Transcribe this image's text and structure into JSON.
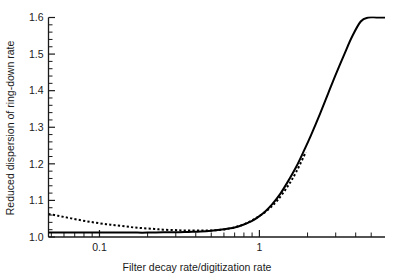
{
  "chart_data": {
    "type": "line",
    "title": "",
    "xlabel": "Filter decay rate/digitization rate",
    "ylabel": "Reduced dispersion of ring-down rate",
    "xscale": "log",
    "yscale": "linear",
    "xlim": [
      0.048,
      6.1
    ],
    "ylim": [
      1.0,
      1.6
    ],
    "grid": false,
    "legend": "none",
    "x_tick_labels": [
      "0.1",
      "1"
    ],
    "x_tick_values": [
      0.1,
      1
    ],
    "x_minor_ticks": [
      0.05,
      0.06,
      0.07,
      0.08,
      0.09,
      0.2,
      0.3,
      0.4,
      0.5,
      0.6,
      0.7,
      0.8,
      0.9,
      2,
      3,
      4,
      5
    ],
    "y_tick_labels": [
      "1.0",
      "1.1",
      "1.2",
      "1.3",
      "1.4",
      "1.5",
      "1.6"
    ],
    "y_tick_values": [
      1.0,
      1.1,
      1.2,
      1.3,
      1.4,
      1.5,
      1.6
    ],
    "y_minor_tick_count_between_majors": 4,
    "series": [
      {
        "name": "solid-curve",
        "style": "solid",
        "color": "#000000",
        "x": [
          0.048,
          0.06,
          0.08,
          0.1,
          0.13,
          0.16,
          0.2,
          0.25,
          0.3,
          0.36,
          0.43,
          0.5,
          0.6,
          0.7,
          0.8,
          0.9,
          1.0,
          1.1,
          1.2,
          1.35,
          1.5,
          1.7,
          1.9,
          2.1,
          2.4,
          2.7,
          3.0,
          3.4,
          3.8,
          4.3,
          4.8,
          5.4,
          6.1
        ],
        "y": [
          1.012,
          1.012,
          1.012,
          1.012,
          1.012,
          1.012,
          1.012,
          1.013,
          1.013,
          1.014,
          1.015,
          1.017,
          1.021,
          1.026,
          1.034,
          1.044,
          1.057,
          1.072,
          1.089,
          1.118,
          1.15,
          1.192,
          1.236,
          1.278,
          1.338,
          1.394,
          1.444,
          1.5,
          1.548,
          1.589,
          1.6,
          1.6,
          1.6
        ]
      },
      {
        "name": "dotted-curve",
        "style": "dotted",
        "color": "#000000",
        "x": [
          0.048,
          0.055,
          0.063,
          0.072,
          0.083,
          0.095,
          0.11,
          0.125,
          0.145,
          0.165,
          0.19,
          0.22,
          0.25,
          0.29,
          0.33,
          0.38,
          0.44,
          0.5,
          0.58,
          0.66,
          0.76,
          0.87,
          1.0,
          1.15,
          1.3,
          1.5,
          1.7,
          1.95
        ],
        "y": [
          1.063,
          1.058,
          1.053,
          1.048,
          1.043,
          1.039,
          1.035,
          1.032,
          1.029,
          1.026,
          1.024,
          1.022,
          1.02,
          1.019,
          1.018,
          1.018,
          1.018,
          1.018,
          1.02,
          1.024,
          1.031,
          1.042,
          1.057,
          1.077,
          1.101,
          1.138,
          1.178,
          1.232
        ]
      }
    ]
  },
  "axis_titles": {
    "x": "Filter decay rate/digitization rate",
    "y": "Reduced dispersion of ring-down rate"
  }
}
